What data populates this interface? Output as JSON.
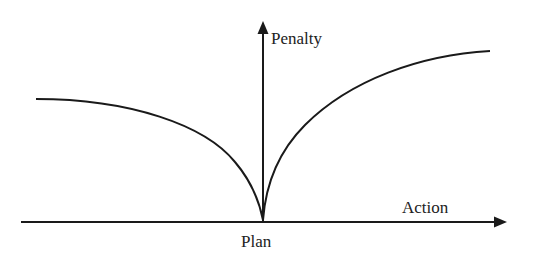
{
  "diagram": {
    "type": "penalty-function",
    "y_axis_label": "Penalty",
    "x_axis_label": "Action",
    "origin_label": "Plan",
    "line_color": "#1a1a1a",
    "text_color": "#222222"
  }
}
